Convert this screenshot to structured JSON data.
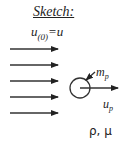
{
  "sketch": {
    "title": "Sketch:",
    "inlet_velocity_label": {
      "var": "u",
      "sub": "(0)",
      "rhs": "=u"
    },
    "particle_mass_label": {
      "var": "m",
      "sub": "p"
    },
    "particle_velocity_label": {
      "var": "u",
      "sub": "p"
    },
    "fluid_properties": "ρ, μ",
    "flow_arrows_count": 5,
    "colors": {
      "stroke": "#222222",
      "background": "#ffffff"
    }
  }
}
